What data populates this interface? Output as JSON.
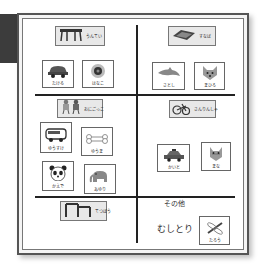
{
  "board": {
    "sections": [
      {
        "id": "top-left",
        "header": {
          "icon": "playground-bars-icon",
          "label": "うんてい"
        },
        "cards": [
          {
            "icon": "car-icon",
            "label": "たける"
          },
          {
            "icon": "flower-icon",
            "label": "はなこ"
          }
        ]
      },
      {
        "id": "top-right",
        "header": {
          "icon": "sandbox-icon",
          "label": "すなば"
        },
        "cards": [
          {
            "icon": "dolphin-icon",
            "label": "さとし"
          },
          {
            "icon": "fox-icon",
            "label": "まひろ"
          }
        ]
      },
      {
        "id": "middle-left",
        "header": {
          "icon": "tag-game-icon",
          "label": "おにごっこ"
        },
        "cards": [
          {
            "icon": "bus-icon",
            "label": "ゆうすけ"
          },
          {
            "icon": "bone-icon",
            "label": "ゆうま"
          },
          {
            "icon": "panda-icon",
            "label": "かえで"
          },
          {
            "icon": "elephant-icon",
            "label": "あゆり"
          }
        ]
      },
      {
        "id": "middle-right",
        "header": {
          "icon": "tricycle-icon",
          "label": "さんりんしゃ"
        },
        "cards": [
          {
            "icon": "taxi-icon",
            "label": "かいと"
          },
          {
            "icon": "cat-icon",
            "label": "まな"
          }
        ]
      },
      {
        "id": "bottom-left",
        "header": {
          "icon": "iron-bar-icon",
          "label": "てつぼう"
        },
        "cards": []
      },
      {
        "id": "bottom-right",
        "title": "その他",
        "activity": "むしとり",
        "cards": [
          {
            "icon": "dragonfly-icon",
            "label": "たろう"
          }
        ]
      }
    ]
  },
  "colors": {
    "board_border": "#555555",
    "grid_line": "#222222",
    "header_fill": "#e8e8e8",
    "dark_block": "#3c3c3c"
  }
}
